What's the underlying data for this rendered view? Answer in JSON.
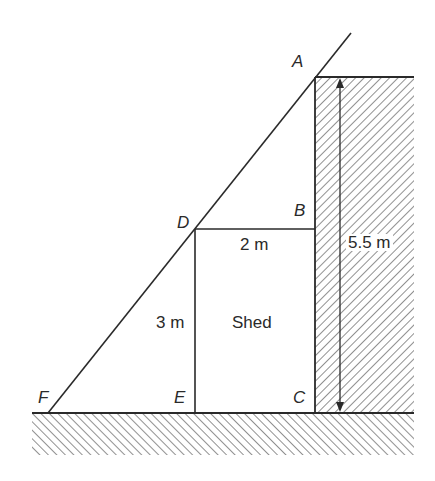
{
  "diagram": {
    "points": {
      "A": "A",
      "B": "B",
      "C": "C",
      "D": "D",
      "E": "E",
      "F": "F"
    },
    "labels": {
      "shed": "Shed",
      "shed_width": "2 m",
      "shed_height": "3 m",
      "wall_height": "5.5 m"
    },
    "colors": {
      "line": "#2a2a2a",
      "hatch": "#555555",
      "background": "#ffffff"
    }
  }
}
